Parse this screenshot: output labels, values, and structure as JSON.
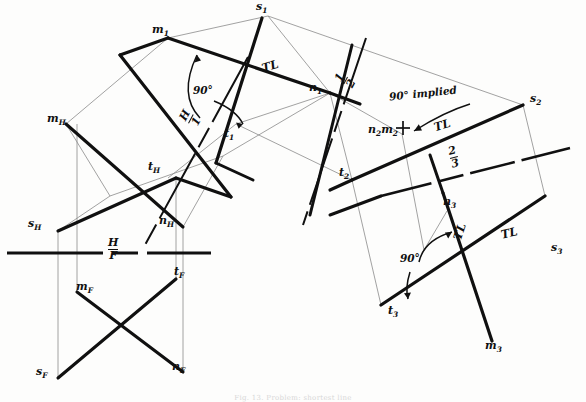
{
  "figure": {
    "caption": "Fig. 13. Problem: shortest line",
    "background_color": "#fdfdfc",
    "ink_color": "#101010",
    "projector_color": "#7d7d7d"
  },
  "views": {
    "horizontal": {
      "name": "H"
    },
    "frontal": {
      "name": "F"
    },
    "aux1": {
      "name": "1"
    },
    "aux2": {
      "name": "2"
    },
    "aux3": {
      "name": "3"
    }
  },
  "fold_lines": [
    {
      "id": "hf",
      "upper": "H",
      "lower": "F"
    },
    {
      "id": "h1",
      "upper": "H",
      "lower": "1"
    },
    {
      "id": "12",
      "upper": "1",
      "lower": "2"
    },
    {
      "id": "23",
      "upper": "2",
      "lower": "3"
    }
  ],
  "point_labels": [
    {
      "id": "m1",
      "base": "m",
      "sub": "1",
      "x": 155,
      "y": 29
    },
    {
      "id": "s1",
      "base": "s",
      "sub": "1",
      "x": 258,
      "y": 4
    },
    {
      "id": "n1",
      "base": "n",
      "sub": "1",
      "x": 312,
      "y": 86
    },
    {
      "id": "t1",
      "base": "t",
      "sub": "1",
      "x": 227,
      "y": 133
    },
    {
      "id": "mH",
      "base": "m",
      "sub": "H",
      "x": 50,
      "y": 118
    },
    {
      "id": "tH",
      "base": "t",
      "sub": "H",
      "x": 151,
      "y": 166
    },
    {
      "id": "sH",
      "base": "s",
      "sub": "H",
      "x": 31,
      "y": 223
    },
    {
      "id": "nH",
      "base": "n",
      "sub": "H",
      "x": 162,
      "y": 220
    },
    {
      "id": "mF",
      "base": "m",
      "sub": "F",
      "x": 79,
      "y": 286
    },
    {
      "id": "tF",
      "base": "t",
      "sub": "F",
      "x": 177,
      "y": 271
    },
    {
      "id": "sF",
      "base": "s",
      "sub": "F",
      "x": 39,
      "y": 371
    },
    {
      "id": "nF",
      "base": "n",
      "sub": "F",
      "x": 175,
      "y": 366
    },
    {
      "id": "s2",
      "base": "s",
      "sub": "2",
      "x": 533,
      "y": 97
    },
    {
      "id": "t2",
      "base": "t",
      "sub": "2",
      "x": 342,
      "y": 172
    },
    {
      "id": "n2m2",
      "base": "n2m2",
      "sub": "",
      "x": 390,
      "y": 130
    },
    {
      "id": "n3",
      "base": "n",
      "sub": "3",
      "x": 446,
      "y": 200
    },
    {
      "id": "s3",
      "base": "s",
      "sub": "3",
      "x": 554,
      "y": 246
    },
    {
      "id": "t3",
      "base": "t",
      "sub": "3",
      "x": 391,
      "y": 310
    },
    {
      "id": "m3",
      "base": "m",
      "sub": "3",
      "x": 488,
      "y": 345
    }
  ],
  "tl_labels": [
    {
      "id": "tl-aux1",
      "text": "TL",
      "x": 266,
      "y": 68,
      "rotate": -17
    },
    {
      "id": "tl-aux2",
      "text": "TL",
      "x": 438,
      "y": 127,
      "rotate": -16
    },
    {
      "id": "tl-aux3-vertical",
      "text": "TL",
      "x": 457,
      "y": 232,
      "rotate": -72
    },
    {
      "id": "tl-aux3-horizontal",
      "text": "TL",
      "x": 505,
      "y": 234,
      "rotate": -13
    }
  ],
  "angle_labels": [
    {
      "id": "angle-90-aux1",
      "text": "90°",
      "x": 196,
      "y": 90
    },
    {
      "id": "angle-90-aux3",
      "text": "90°",
      "x": 404,
      "y": 258
    }
  ],
  "notes": [
    {
      "id": "note-90-implied",
      "text": "90° implied",
      "x": 394,
      "y": 94,
      "rotate": -6
    }
  ],
  "fold_line_labels": [
    {
      "id": "fold-hf",
      "upper": "H",
      "lower": "F",
      "x": 113,
      "y": 246,
      "rotate": 0
    },
    {
      "id": "fold-h1",
      "upper": "H",
      "lower": "1",
      "x": 192,
      "y": 116,
      "rotate": -62
    },
    {
      "id": "fold-12",
      "upper": "1",
      "lower": "2",
      "x": 347,
      "y": 78,
      "rotate": -62
    },
    {
      "id": "fold-23",
      "upper": "2",
      "lower": "3",
      "x": 455,
      "y": 155,
      "rotate": -14
    }
  ]
}
